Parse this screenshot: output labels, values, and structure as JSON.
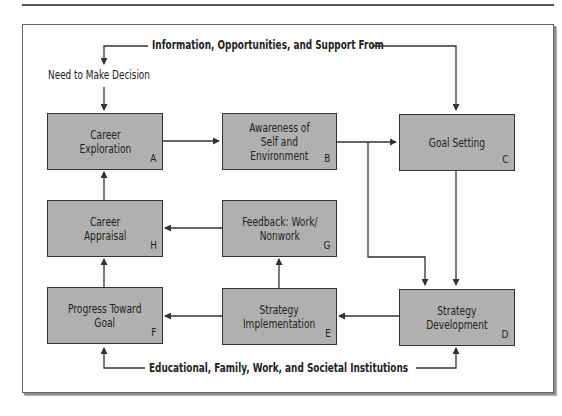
{
  "diagram": {
    "top_label": "Information, Opportunities, and Support From",
    "bottom_label": "Educational, Family, Work, and Societal Institutions",
    "decision_label": "Need to Make Decision",
    "colors": {
      "box_fill": "#b0b0b0",
      "box_border": "#333333",
      "line": "#333333",
      "background": "#ffffff"
    },
    "boxes": [
      {
        "id": "A",
        "label": "Career\nExploration",
        "letter": "A"
      },
      {
        "id": "B",
        "label": "Awareness of\nSelf and\nEnvironment",
        "letter": "B"
      },
      {
        "id": "C",
        "label": "Goal Setting",
        "letter": "C"
      },
      {
        "id": "D",
        "label": "Strategy\nDevelopment",
        "letter": "D"
      },
      {
        "id": "E",
        "label": "Strategy\nImplementation",
        "letter": "E"
      },
      {
        "id": "F",
        "label": "Progress Toward\nGoal",
        "letter": "F"
      },
      {
        "id": "G",
        "label": "Feedback: Work/\nNonwork",
        "letter": "G"
      },
      {
        "id": "H",
        "label": "Career\nAppraisal",
        "letter": "H"
      }
    ],
    "edges": [
      {
        "from": "top_label",
        "to": "A",
        "via": "Need to Make Decision"
      },
      {
        "from": "top_label",
        "to": "C"
      },
      {
        "from": "A",
        "to": "B"
      },
      {
        "from": "B",
        "to": "C"
      },
      {
        "from": "B",
        "to": "D"
      },
      {
        "from": "C",
        "to": "D"
      },
      {
        "from": "D",
        "to": "E"
      },
      {
        "from": "E",
        "to": "F"
      },
      {
        "from": "E",
        "to": "G"
      },
      {
        "from": "G",
        "to": "H"
      },
      {
        "from": "F",
        "to": "H"
      },
      {
        "from": "H",
        "to": "A"
      },
      {
        "from": "bottom_label",
        "to": "F"
      },
      {
        "from": "bottom_label",
        "to": "D"
      }
    ]
  }
}
